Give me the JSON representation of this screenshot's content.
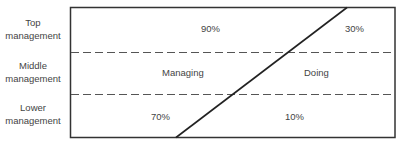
{
  "levels": [
    {
      "label_line1": "Top",
      "label_line2": "management"
    },
    {
      "label_line1": "Middle",
      "label_line2": "management"
    },
    {
      "label_line1": "Lower",
      "label_line2": "management"
    }
  ],
  "regions": {
    "left": {
      "name": "Managing"
    },
    "right": {
      "name": "Doing"
    }
  },
  "percentages": {
    "top_managing": "90%",
    "top_doing": "30%",
    "lower_managing": "70%",
    "lower_doing": "10%"
  }
}
